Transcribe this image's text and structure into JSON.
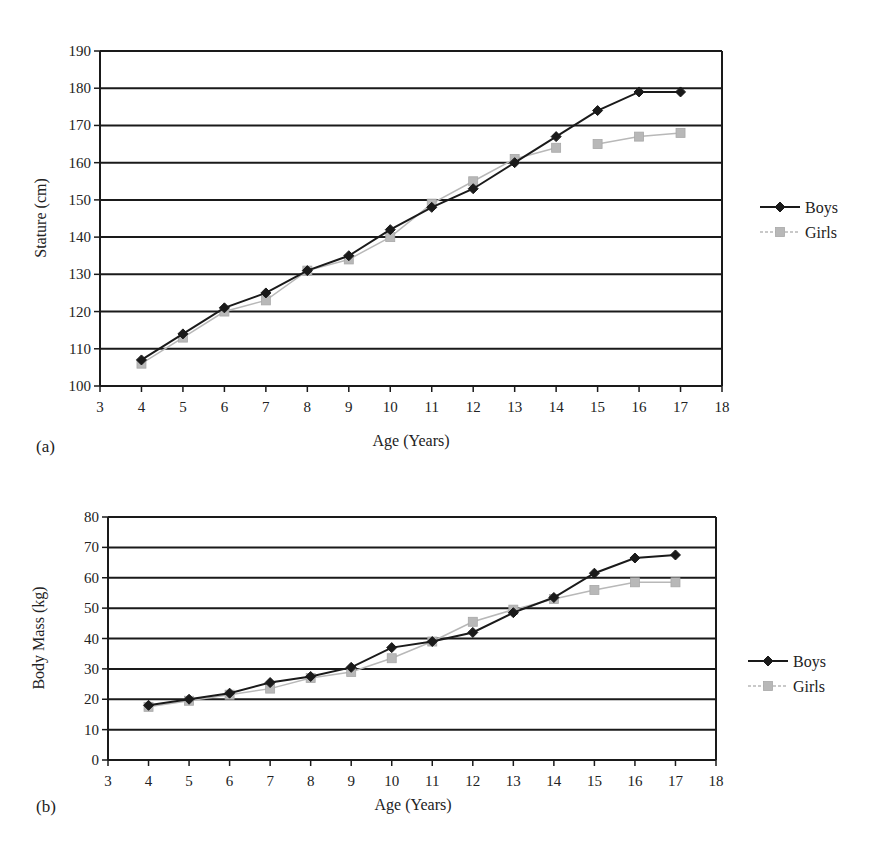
{
  "chart_data": [
    {
      "panel": "(a)",
      "type": "line",
      "title": "",
      "xlabel": "Age (Years)",
      "ylabel": "Stature (cm)",
      "xlim": [
        3,
        18
      ],
      "ylim": [
        100,
        190
      ],
      "xticks": [
        3,
        4,
        5,
        6,
        7,
        8,
        9,
        10,
        11,
        12,
        13,
        14,
        15,
        16,
        17,
        18
      ],
      "yticks": [
        100,
        110,
        120,
        130,
        140,
        150,
        160,
        170,
        180,
        190
      ],
      "grid": "horizontal",
      "legend_position": "right",
      "x": [
        4,
        5,
        6,
        7,
        8,
        9,
        10,
        11,
        12,
        13,
        14,
        15,
        16,
        17
      ],
      "series": [
        {
          "name": "Boys",
          "color": "#1a1a1a",
          "marker": "diamond",
          "values": [
            107,
            114,
            121,
            125,
            131,
            135,
            142,
            148,
            153,
            160,
            167,
            174,
            179,
            179
          ]
        },
        {
          "name": "Girls",
          "color": "#b8b8b8",
          "marker": "square",
          "values": [
            106,
            113,
            120,
            123,
            131,
            134,
            140,
            149,
            155,
            161,
            164,
            165,
            167,
            168
          ],
          "gap_after_index": 10
        }
      ]
    },
    {
      "panel": "(b)",
      "type": "line",
      "title": "",
      "xlabel": "Age (Years)",
      "ylabel": "Body Mass (kg)",
      "xlim": [
        3,
        18
      ],
      "ylim": [
        0,
        80
      ],
      "xticks": [
        3,
        4,
        5,
        6,
        7,
        8,
        9,
        10,
        11,
        12,
        13,
        14,
        15,
        16,
        17,
        18
      ],
      "yticks": [
        0,
        10,
        20,
        30,
        40,
        50,
        60,
        70,
        80
      ],
      "grid": "horizontal",
      "legend_position": "right",
      "x": [
        4,
        5,
        6,
        7,
        8,
        9,
        10,
        11,
        12,
        13,
        14,
        15,
        16,
        17
      ],
      "series": [
        {
          "name": "Boys",
          "color": "#1a1a1a",
          "marker": "diamond",
          "values": [
            18,
            20,
            22,
            25.5,
            27.5,
            30.5,
            37,
            39,
            42,
            48.5,
            53.5,
            61.5,
            66.5,
            67.5
          ]
        },
        {
          "name": "Girls",
          "color": "#b8b8b8",
          "marker": "square",
          "values": [
            17.5,
            19.5,
            21.5,
            23.5,
            27,
            29,
            33.5,
            39,
            45.5,
            49.5,
            53,
            56,
            58.5,
            58.5
          ]
        }
      ]
    }
  ],
  "layout": [
    {
      "plot": {
        "left": 100,
        "right": 722,
        "top": 51,
        "bottom": 386
      },
      "legend": {
        "x": 760,
        "y": 207
      },
      "panel_label_pos": [
        36,
        452
      ],
      "xlabel_pos": [
        411,
        446
      ],
      "ylabel_pos": [
        46,
        218
      ]
    },
    {
      "plot": {
        "left": 108,
        "right": 716,
        "top": 517,
        "bottom": 760
      },
      "legend": {
        "x": 748,
        "y": 661
      },
      "panel_label_pos": [
        36,
        812
      ],
      "xlabel_pos": [
        413,
        810
      ],
      "ylabel_pos": [
        44,
        638
      ]
    }
  ]
}
